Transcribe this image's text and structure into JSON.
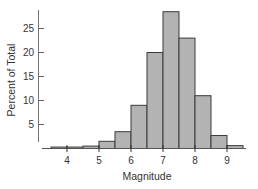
{
  "chart_data": {
    "type": "bar",
    "subtype": "histogram",
    "title": "",
    "xlabel": "Magnitude",
    "ylabel": "Percent of Total",
    "bin_width": 0.5,
    "bins": [
      {
        "start": 3.5,
        "end": 4.0,
        "value": 0.3
      },
      {
        "start": 4.0,
        "end": 4.5,
        "value": 0.3
      },
      {
        "start": 4.5,
        "end": 5.0,
        "value": 0.5
      },
      {
        "start": 5.0,
        "end": 5.5,
        "value": 1.5
      },
      {
        "start": 5.5,
        "end": 6.0,
        "value": 3.5
      },
      {
        "start": 6.0,
        "end": 6.5,
        "value": 9.0
      },
      {
        "start": 6.5,
        "end": 7.0,
        "value": 20.0
      },
      {
        "start": 7.0,
        "end": 7.5,
        "value": 28.5
      },
      {
        "start": 7.5,
        "end": 8.0,
        "value": 23.0
      },
      {
        "start": 8.0,
        "end": 8.5,
        "value": 11.0
      },
      {
        "start": 8.5,
        "end": 9.0,
        "value": 2.7
      },
      {
        "start": 9.0,
        "end": 9.5,
        "value": 0.6
      }
    ],
    "categories": [
      "3.5-4.0",
      "4.0-4.5",
      "4.5-5.0",
      "5.0-5.5",
      "5.5-6.0",
      "6.0-6.5",
      "6.5-7.0",
      "7.0-7.5",
      "7.5-8.0",
      "8.0-8.5",
      "8.5-9.0",
      "9.0-9.5"
    ],
    "values": [
      0.3,
      0.3,
      0.5,
      1.5,
      3.5,
      9.0,
      20.0,
      28.5,
      23.0,
      11.0,
      2.7,
      0.6
    ],
    "x_ticks": [
      4,
      5,
      6,
      7,
      8,
      9
    ],
    "y_ticks": [
      5,
      10,
      15,
      20,
      25
    ],
    "xlim": [
      3.5,
      9.5
    ],
    "ylim": [
      0,
      29
    ],
    "grid": false,
    "legend": null,
    "colors": {
      "bar_fill": "#b3b3b3",
      "bar_edge": "#3a3a3a",
      "axis": "#666666",
      "text": "#333333"
    }
  }
}
